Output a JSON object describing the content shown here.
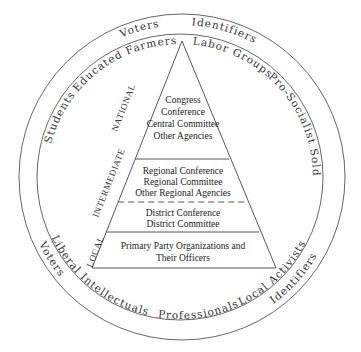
{
  "outer_ring": {
    "top": [
      "Voters",
      "Identifiers"
    ],
    "bottom": [
      "Voters",
      "Identifiers"
    ]
  },
  "inner_ring": {
    "top": [
      "Students",
      "Educated Farmers",
      "Labor Groups",
      "Pro-Socialist Soldiers"
    ],
    "bottom": [
      "Liberal Intellectuals",
      "Professionals",
      "Local Activists"
    ]
  },
  "levels": {
    "national": "NATIONAL",
    "intermediate": "INTERMEDIATE",
    "local": "LOCAL"
  },
  "tiers": [
    {
      "lines": [
        "Congress",
        "Conference",
        "Central Committee",
        "Other Agencies"
      ]
    },
    {
      "lines": [
        "Regional Conference",
        "Regional Committee",
        "Other Regional Agencies"
      ]
    },
    {
      "lines": [
        "District Conference",
        "District Committee"
      ]
    },
    {
      "lines": [
        "Primary Party Organizations and",
        "Their Officers"
      ]
    }
  ],
  "colors": {
    "line": "#444444",
    "text": "#222222",
    "background": "#ffffff"
  }
}
